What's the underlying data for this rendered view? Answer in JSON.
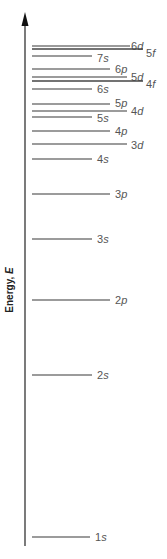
{
  "axis": {
    "label": "Energy, ",
    "label_symbol": "E",
    "x": 25,
    "top": 12,
    "bottom": 546
  },
  "chart_data": {
    "type": "energy-level-diagram",
    "ylabel": "Energy, E",
    "levels": [
      {
        "n": "6",
        "l": "d",
        "y": 46,
        "x1": 32,
        "x2": 130,
        "lx": 131,
        "ly": 50,
        "dark": false
      },
      {
        "n": "5",
        "l": "f",
        "y": 49,
        "x1": 32,
        "x2": 143,
        "lx": 146,
        "ly": 57,
        "dark": true
      },
      {
        "n": "7",
        "l": "s",
        "y": 56,
        "x1": 32,
        "x2": 92,
        "lx": 97,
        "ly": 62,
        "dark": false
      },
      {
        "n": "6",
        "l": "p",
        "y": 69,
        "x1": 32,
        "x2": 110,
        "lx": 115,
        "ly": 73,
        "dark": false
      },
      {
        "n": "5",
        "l": "d",
        "y": 77,
        "x1": 32,
        "x2": 127,
        "lx": 131,
        "ly": 81,
        "dark": false
      },
      {
        "n": "4",
        "l": "f",
        "y": 81,
        "x1": 32,
        "x2": 143,
        "lx": 146,
        "ly": 88,
        "dark": true
      },
      {
        "n": "6",
        "l": "s",
        "y": 89,
        "x1": 32,
        "x2": 92,
        "lx": 97,
        "ly": 93,
        "dark": false
      },
      {
        "n": "5",
        "l": "p",
        "y": 104,
        "x1": 32,
        "x2": 110,
        "lx": 115,
        "ly": 107,
        "dark": false
      },
      {
        "n": "4",
        "l": "d",
        "y": 111,
        "x1": 32,
        "x2": 127,
        "lx": 131,
        "ly": 115,
        "dark": false
      },
      {
        "n": "5",
        "l": "s",
        "y": 117,
        "x1": 32,
        "x2": 92,
        "lx": 97,
        "ly": 122,
        "dark": false
      },
      {
        "n": "4",
        "l": "p",
        "y": 131,
        "x1": 32,
        "x2": 110,
        "lx": 115,
        "ly": 135,
        "dark": false
      },
      {
        "n": "3",
        "l": "d",
        "y": 144,
        "x1": 32,
        "x2": 127,
        "lx": 131,
        "ly": 149,
        "dark": false
      },
      {
        "n": "4",
        "l": "s",
        "y": 159,
        "x1": 32,
        "x2": 92,
        "lx": 97,
        "ly": 163,
        "dark": false
      },
      {
        "n": "3",
        "l": "p",
        "y": 194,
        "x1": 32,
        "x2": 110,
        "lx": 115,
        "ly": 198,
        "dark": false
      },
      {
        "n": "3",
        "l": "s",
        "y": 239,
        "x1": 32,
        "x2": 92,
        "lx": 97,
        "ly": 243,
        "dark": false
      },
      {
        "n": "2",
        "l": "p",
        "y": 300,
        "x1": 32,
        "x2": 110,
        "lx": 115,
        "ly": 304,
        "dark": false
      },
      {
        "n": "2",
        "l": "s",
        "y": 375,
        "x1": 32,
        "x2": 92,
        "lx": 97,
        "ly": 379,
        "dark": false
      },
      {
        "n": "1",
        "l": "s",
        "y": 537,
        "x1": 32,
        "x2": 90,
        "lx": 95,
        "ly": 541,
        "dark": false
      }
    ]
  }
}
